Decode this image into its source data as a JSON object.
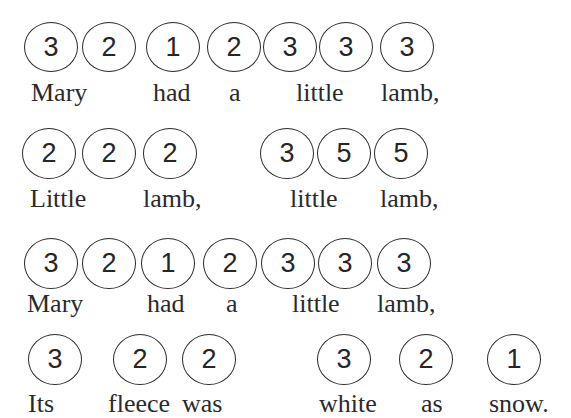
{
  "title": "Mary Had a Little Lamb",
  "rows": [
    {
      "notes": [
        "3",
        "2",
        "1",
        "2",
        "3",
        "3",
        "3"
      ],
      "words": [
        "Mary",
        "had",
        "a",
        "little",
        "lamb,"
      ]
    },
    {
      "notes": [
        "2",
        "2",
        "2",
        "3",
        "5",
        "5"
      ],
      "words": [
        "Little",
        "lamb,",
        "little",
        "lamb,"
      ]
    },
    {
      "notes": [
        "3",
        "2",
        "1",
        "2",
        "3",
        "3",
        "3"
      ],
      "words": [
        "Mary",
        "had",
        "a",
        "little",
        "lamb,"
      ]
    },
    {
      "notes": [
        "3",
        "2",
        "2",
        "3",
        "2",
        "1"
      ],
      "words": [
        "Its",
        "fleece",
        "was",
        "white",
        "as",
        "snow."
      ]
    }
  ]
}
